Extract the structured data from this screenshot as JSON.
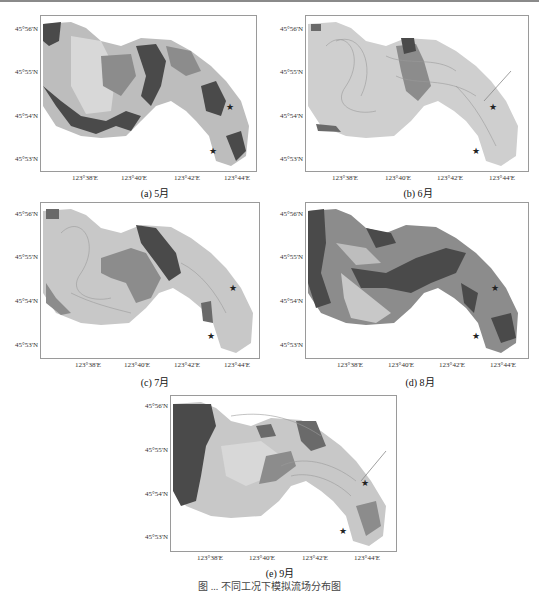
{
  "figure": {
    "caption": "图 ... 不同工况下模拟流场分布图",
    "axes": {
      "y_ticks": [
        "45°56'N",
        "45°55'N",
        "45°54'N",
        "45°53'N"
      ],
      "x_ticks": [
        "123°38'E",
        "123°40'E",
        "123°42'E",
        "123°44'E"
      ]
    },
    "markers": {
      "upper_label": "进水口",
      "lower_label": "出水口"
    },
    "colors": {
      "dark": "#4a4a4a",
      "mid": "#8c8c8c",
      "light": "#bdbdbd",
      "pale": "#d8d8d8",
      "frame": "#9a9a9a"
    },
    "panels": [
      {
        "id": "a",
        "caption": "(a) 5月",
        "dominant": "dark-mid"
      },
      {
        "id": "b",
        "caption": "(b) 6月",
        "dominant": "light"
      },
      {
        "id": "c",
        "caption": "(c) 7月",
        "dominant": "light-mid"
      },
      {
        "id": "d",
        "caption": "(d) 8月",
        "dominant": "dark-mid"
      },
      {
        "id": "e",
        "caption": "(e) 9月",
        "dominant": "dark-light"
      }
    ]
  }
}
